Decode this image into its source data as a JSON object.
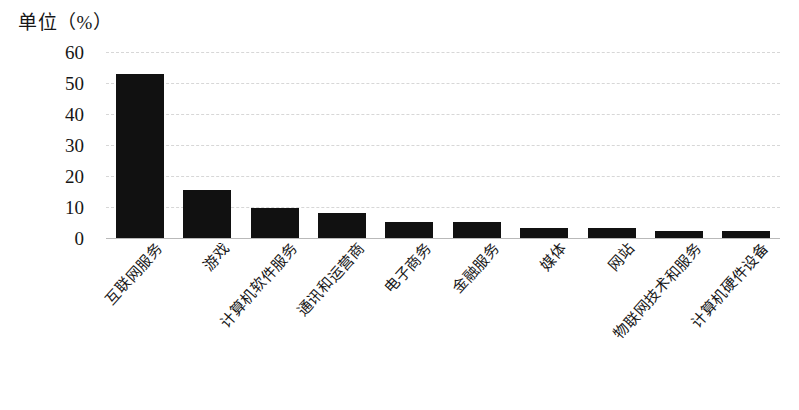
{
  "chart_data": {
    "type": "bar",
    "title": "单位（%）",
    "xlabel": "",
    "ylabel": "",
    "ylim": [
      0,
      60
    ],
    "yticks": [
      0,
      10,
      20,
      30,
      40,
      50,
      60
    ],
    "grid": true,
    "legend": null,
    "bar_color": "#111111",
    "gridline_color": "#d7d7d7",
    "axis_color": "#b9b9b9",
    "categories": [
      "互联网服务",
      "游戏",
      "计算机软件服务",
      "通讯和运营商",
      "电子商务",
      "金融服务",
      "媒体",
      "网站",
      "物联网技术和服务",
      "计算机硬件设备"
    ],
    "values": [
      52.8,
      15.6,
      9.7,
      8.0,
      5.3,
      5.3,
      3.3,
      3.3,
      2.2,
      2.2
    ]
  }
}
